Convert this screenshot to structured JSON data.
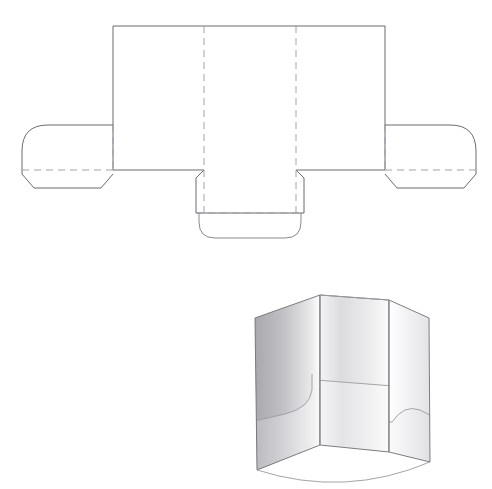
{
  "document": {
    "title": "Presentation folder dieline and 3D folded view",
    "background_color": "#ffffff",
    "width": 492,
    "height": 489
  },
  "style": {
    "cut_line_color": "#5a5a5f",
    "fold_line_color": "#9a9aa0",
    "render_light": "#ffffff",
    "render_mid": "#d8d8da",
    "render_dark": "#9e9ea2",
    "render_edge": "#6f6f74",
    "fold_dash_pattern": "7 5",
    "line_width": 0.9
  },
  "dieline": {
    "name": "flat-cut-pattern",
    "label": "Folder dieline (flat)",
    "geometry": {
      "main_panel": {
        "left": 113,
        "right": 385,
        "top": 26,
        "bottom": 170
      },
      "vertical_fold_x": [
        204,
        296
      ],
      "baseline_y": 170,
      "wing_top_y": 125,
      "left_wing": {
        "outer_x": 22,
        "inner_x": 113,
        "corner_radius": 26,
        "bottom_y": 188,
        "taper": 12
      },
      "right_wing": {
        "outer_x": 476,
        "inner_x": 385,
        "corner_radius": 26,
        "bottom_y": 188,
        "taper": 12
      },
      "bottom_tab": {
        "left": 196,
        "right": 304,
        "top": 170,
        "fold_y": 213,
        "flap_bottom_y": 238,
        "flap_radius": 16,
        "shoulder_inset": 8
      }
    },
    "parts": [
      {
        "name": "left-panel",
        "type": "panel"
      },
      {
        "name": "center-panel",
        "type": "panel"
      },
      {
        "name": "right-panel",
        "type": "panel"
      },
      {
        "name": "left-pocket-wing",
        "type": "glue-flap"
      },
      {
        "name": "right-pocket-wing",
        "type": "glue-flap"
      },
      {
        "name": "center-bottom-tab",
        "type": "tuck-flap"
      }
    ]
  },
  "render": {
    "name": "folded-3d-view",
    "label": "Folded presentation folder, perspective view",
    "panels": [
      {
        "name": "left-panel",
        "shade": "mid-to-dark"
      },
      {
        "name": "center-panel",
        "shade": "light-to-mid"
      },
      {
        "name": "right-panel",
        "shade": "light"
      }
    ],
    "pockets": [
      {
        "name": "left-pocket",
        "corner": "rounded-top-right"
      },
      {
        "name": "center-pocket",
        "corner": "square"
      },
      {
        "name": "right-pocket",
        "corner": "rounded-top-left"
      }
    ],
    "geometry": {
      "top_left": [
        255,
        318
      ],
      "top_fold_left": [
        320,
        295
      ],
      "top_fold_right": [
        389,
        300
      ],
      "top_right": [
        429,
        318
      ],
      "bottom_left": [
        257,
        470
      ],
      "bottom_fold_left": [
        320,
        445
      ],
      "bottom_fold_right": [
        389,
        452
      ],
      "bottom_right": [
        430,
        462
      ]
    }
  }
}
